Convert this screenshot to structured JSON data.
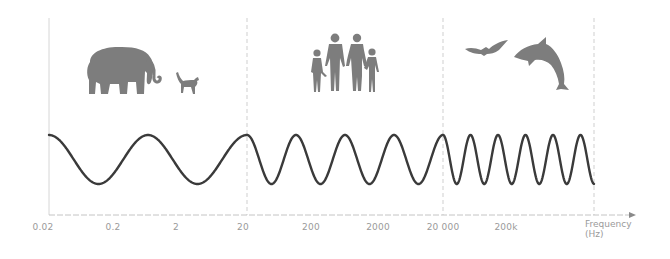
{
  "diagram": {
    "axis": {
      "label_line1": "Frequency",
      "label_line2": "(Hz)",
      "ticks": [
        {
          "label": "0.02",
          "x": 43
        },
        {
          "label": "0.2",
          "x": 113
        },
        {
          "label": "2",
          "x": 176
        },
        {
          "label": "20",
          "x": 243
        },
        {
          "label": "200",
          "x": 311
        },
        {
          "label": "2000",
          "x": 378
        },
        {
          "label": "20 000",
          "x": 443
        },
        {
          "label": "200k",
          "x": 506
        }
      ]
    },
    "sections": [
      {
        "name": "infrasound",
        "range": "0.02–20 Hz",
        "animals": [
          "elephant",
          "cat"
        ]
      },
      {
        "name": "audible",
        "range": "20–20 000 Hz",
        "animals": [
          "humans (family)"
        ]
      },
      {
        "name": "ultrasound",
        "range": "20 000 Hz – 200k+",
        "animals": [
          "bat",
          "dolphin"
        ]
      }
    ],
    "colors": {
      "wave": "#3a3a3a",
      "silhouette": "#7d7d7d",
      "axis": "#bdbdbd",
      "divider": "#cfcfcf",
      "label": "#9a9a9a"
    }
  }
}
